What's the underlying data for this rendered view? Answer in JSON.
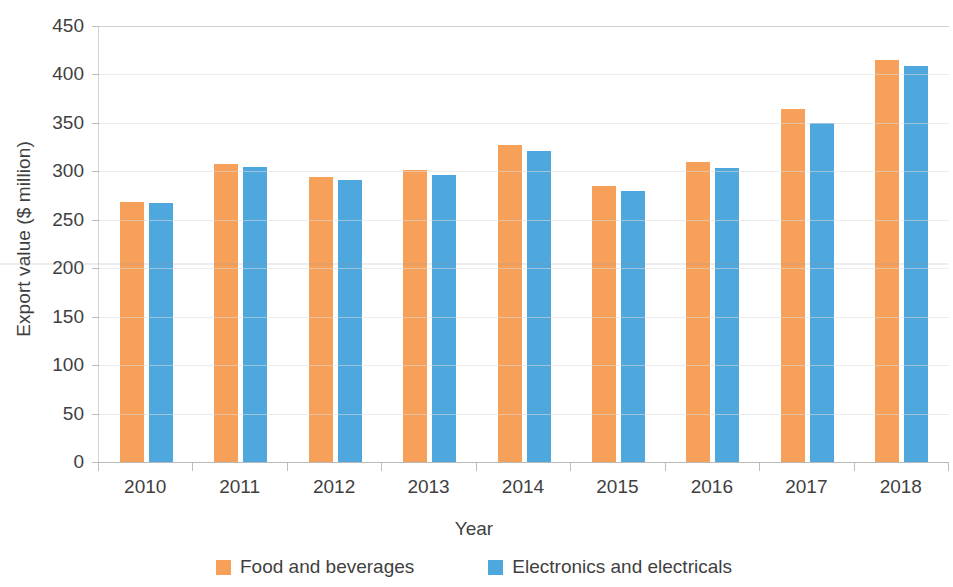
{
  "chart_data": {
    "type": "bar",
    "title": "",
    "xlabel": "Year",
    "ylabel": "Export value ($ million)",
    "categories": [
      "2010",
      "2011",
      "2012",
      "2013",
      "2014",
      "2015",
      "2016",
      "2017",
      "2018"
    ],
    "series": [
      {
        "name": "Food and beverages",
        "color": "#f7a05a",
        "values": [
          268,
          308,
          294,
          301,
          327,
          285,
          310,
          364,
          415
        ]
      },
      {
        "name": "Electronics and electricals",
        "color": "#4ea8de",
        "values": [
          267,
          305,
          291,
          296,
          321,
          280,
          303,
          350,
          409
        ]
      }
    ],
    "ylim": [
      0,
      450
    ],
    "ytick_step": 50,
    "yticks": [
      "0",
      "50",
      "100",
      "150",
      "200",
      "250",
      "300",
      "350",
      "400",
      "450"
    ],
    "grid": true,
    "grid_axis": "y",
    "legend_position": "bottom"
  },
  "legend": {
    "items": [
      {
        "label": "Food and beverages",
        "swatch": "legend-swatch-food"
      },
      {
        "label": "Electronics and electricals",
        "swatch": "legend-swatch-electronics"
      }
    ]
  }
}
